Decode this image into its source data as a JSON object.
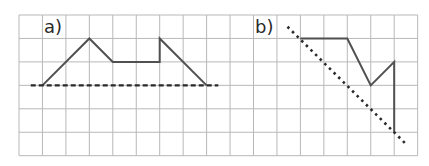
{
  "figure": {
    "grid": {
      "x0": 19,
      "y0": 15,
      "cell": 23.45,
      "cols": 17,
      "rows": 6,
      "line_color": "#b8b8b8"
    },
    "panels": [
      {
        "id": "a",
        "label": "a)",
        "label_pos": [
          44,
          33
        ],
        "shape_points": [
          [
            1,
            3
          ],
          [
            3,
            1
          ],
          [
            4,
            2
          ],
          [
            6,
            2
          ],
          [
            6,
            1
          ],
          [
            8,
            3
          ]
        ],
        "axis_line": {
          "style": "dashed",
          "from": [
            0.5,
            3
          ],
          "to": [
            8.5,
            3
          ]
        }
      },
      {
        "id": "b",
        "label": "b)",
        "label_pos": [
          255,
          33
        ],
        "shape_points": [
          [
            12,
            1
          ],
          [
            14,
            1
          ],
          [
            15,
            3
          ],
          [
            16,
            2
          ],
          [
            16,
            5
          ]
        ],
        "axis_line": {
          "style": "dotted",
          "from": [
            11.45,
            0.5
          ],
          "to": [
            16.5,
            5.5
          ]
        }
      }
    ],
    "colors": {
      "shape": "#505050",
      "axis": "#2a2a2a",
      "label": "#2a2a2a"
    }
  }
}
